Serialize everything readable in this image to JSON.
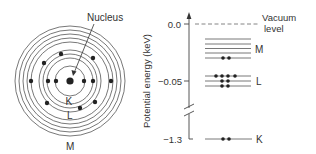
{
  "atom": {
    "nucleus_label": "Nucleus",
    "shell_labels": {
      "K": "K",
      "L": "L",
      "M": "M"
    }
  },
  "energy_diagram": {
    "axis_label": "Potential energy (keV)",
    "ticks": [
      {
        "value": "0.0"
      },
      {
        "value": "−0.05"
      },
      {
        "value": "−1.3"
      }
    ],
    "vacuum_label_line1": "Vacuum",
    "vacuum_label_line2": "level",
    "levels": [
      {
        "shell": "M",
        "label": "M",
        "sublevels": 5,
        "electrons": 2
      },
      {
        "shell": "L",
        "label": "L",
        "sublevels": 3,
        "electrons": 8
      },
      {
        "shell": "K",
        "label": "K",
        "sublevels": 1,
        "electrons": 2
      }
    ]
  },
  "colors": {
    "ink": "#333333",
    "line": "#555555",
    "dashed": "#666666"
  }
}
